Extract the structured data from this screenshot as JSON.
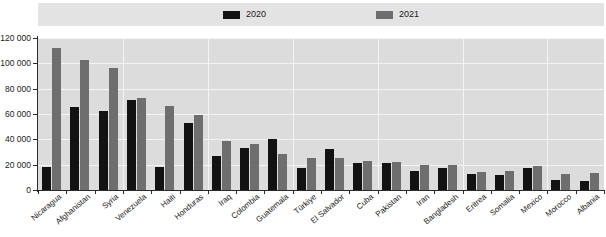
{
  "chart_data": {
    "type": "bar",
    "title": "",
    "subtitle": "",
    "xlabel": "",
    "ylabel": "",
    "ylim": [
      0,
      120000
    ],
    "ytick_labels": [
      "120 000",
      "100 000",
      "80 000",
      "60 000",
      "40 000",
      "20 000",
      "0"
    ],
    "yticks": [
      120000,
      100000,
      80000,
      60000,
      40000,
      20000,
      0
    ],
    "grid": true,
    "legend_position": "top",
    "categories": [
      "Nicaragua",
      "Afghanistan",
      "Syria",
      "Venezuela",
      "Haiti",
      "Honduras",
      "Iraq",
      "Colombia",
      "Guatemala",
      "Türkiye",
      "El Salvador",
      "Cuba",
      "Pakistan",
      "Iran",
      "Bangladesh",
      "Eritrea",
      "Somalia",
      "Mexico",
      "Morocco",
      "Albania"
    ],
    "series": [
      {
        "name": "2020",
        "color": "#121212",
        "values": [
          18000,
          65500,
          62000,
          71000,
          18500,
          53000,
          26500,
          33000,
          40500,
          17500,
          32500,
          21500,
          21000,
          15000,
          17000,
          12500,
          11500,
          17500,
          8000,
          7000
        ]
      },
      {
        "name": "2021",
        "color": "#6e6e6e",
        "values": [
          112000,
          102500,
          96000,
          72500,
          66500,
          59500,
          38500,
          36500,
          28500,
          25000,
          25000,
          23000,
          22500,
          19500,
          19500,
          14500,
          15000,
          19000,
          12500,
          13500
        ]
      }
    ]
  },
  "legend": {
    "entries": [
      {
        "label": "2020",
        "color": "#121212"
      },
      {
        "label": "2021",
        "color": "#6e6e6e"
      }
    ]
  }
}
